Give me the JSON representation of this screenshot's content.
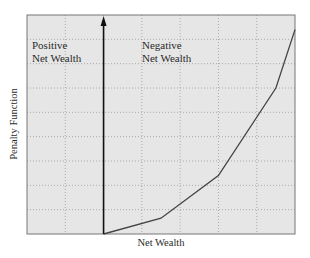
{
  "chart_data": {
    "type": "line",
    "title": "",
    "xlabel": "Net Wealth",
    "ylabel": "Penalty Function",
    "annotations": [
      {
        "text_lines": [
          "Positive",
          "Net Wealth"
        ],
        "position": "left of vertical axis, upper"
      },
      {
        "text_lines": [
          "Negative",
          "Net Wealth"
        ],
        "position": "right of vertical axis, upper"
      }
    ],
    "grid": true,
    "grid_style": "dotted",
    "tick_labels": false,
    "vertical_axis_arrow_at_x": 0,
    "xlim": [
      -2,
      5
    ],
    "ylim": [
      0,
      9
    ],
    "series": [
      {
        "name": "Penalty Function",
        "x": [
          0,
          1.5,
          3.0,
          4.5,
          5.0
        ],
        "y": [
          0,
          0.65,
          2.4,
          6.0,
          8.4
        ]
      }
    ],
    "colors": {
      "plot_background": "#e6e6e6",
      "line": "#444444",
      "grid": "#9a9a9a",
      "axis": "#111111"
    }
  },
  "labels": {
    "xlabel": "Net Wealth",
    "ylabel": "Penalty Function",
    "positive_line1": "Positive",
    "positive_line2": "Net Wealth",
    "negative_line1": "Negative",
    "negative_line2": "Net Wealth"
  }
}
